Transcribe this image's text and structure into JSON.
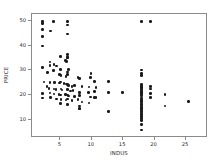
{
  "chart_data": {
    "type": "scatter",
    "title": "",
    "xlabel": "INDUS",
    "ylabel": "PRICE",
    "xlim": [
      0.5,
      28.5
    ],
    "ylim": [
      2.5,
      53.0
    ],
    "xticks": [
      5,
      10,
      15,
      20,
      25
    ],
    "yticks": [
      10,
      20,
      30,
      40,
      50
    ],
    "grid": false,
    "legend": null,
    "marker": {
      "shape": "circle",
      "color": "#1a1a1a",
      "size": 2.6
    },
    "background": "#ffffff",
    "frame_color": "#8a8a8a",
    "points": [
      [
        2.18,
        50.0
      ],
      [
        2.18,
        49.0
      ],
      [
        3.97,
        50.0
      ],
      [
        6.2,
        50.0
      ],
      [
        2.18,
        46.7
      ],
      [
        3.44,
        46.0
      ],
      [
        6.2,
        48.5
      ],
      [
        6.2,
        44.8
      ],
      [
        2.18,
        43.8
      ],
      [
        2.18,
        39.8
      ],
      [
        5.13,
        35.4
      ],
      [
        6.2,
        36.2
      ],
      [
        6.2,
        34.9
      ],
      [
        6.07,
        33.4
      ],
      [
        3.41,
        33.2
      ],
      [
        4.05,
        32.0
      ],
      [
        5.86,
        33.8
      ],
      [
        6.2,
        34.9
      ],
      [
        2.18,
        30.8
      ],
      [
        3.41,
        31.6
      ],
      [
        4.49,
        31.5
      ],
      [
        5.13,
        30.1
      ],
      [
        6.2,
        29.0
      ],
      [
        6.41,
        30.1
      ],
      [
        10.01,
        28.4
      ],
      [
        3.97,
        29.6
      ],
      [
        2.95,
        28.7
      ],
      [
        4.93,
        28.0
      ],
      [
        5.19,
        27.5
      ],
      [
        5.96,
        27.1
      ],
      [
        6.2,
        27.9
      ],
      [
        7.87,
        26.6
      ],
      [
        8.14,
        26.4
      ],
      [
        9.9,
        26.6
      ],
      [
        10.59,
        25.0
      ],
      [
        12.83,
        25.0
      ],
      [
        2.46,
        24.8
      ],
      [
        3.37,
        24.7
      ],
      [
        4.15,
        24.6
      ],
      [
        4.93,
        24.4
      ],
      [
        5.13,
        24.8
      ],
      [
        5.64,
        24.3
      ],
      [
        6.09,
        24.0
      ],
      [
        6.2,
        23.9
      ],
      [
        6.41,
        23.4
      ],
      [
        6.91,
        23.1
      ],
      [
        7.38,
        23.3
      ],
      [
        8.56,
        22.9
      ],
      [
        9.69,
        22.8
      ],
      [
        10.81,
        22.6
      ],
      [
        2.89,
        23.0
      ],
      [
        3.24,
        22.2
      ],
      [
        4.03,
        22.0
      ],
      [
        4.39,
        21.7
      ],
      [
        5.19,
        21.9
      ],
      [
        5.32,
        21.6
      ],
      [
        6.2,
        21.7
      ],
      [
        6.66,
        21.2
      ],
      [
        7.07,
        21.4
      ],
      [
        8.14,
        20.6
      ],
      [
        9.59,
        20.4
      ],
      [
        10.59,
        20.8
      ],
      [
        2.18,
        20.1
      ],
      [
        3.41,
        20.3
      ],
      [
        4.05,
        19.9
      ],
      [
        4.86,
        19.6
      ],
      [
        5.13,
        19.4
      ],
      [
        5.86,
        19.8
      ],
      [
        6.2,
        19.4
      ],
      [
        6.41,
        19.1
      ],
      [
        7.38,
        18.9
      ],
      [
        8.14,
        19.2
      ],
      [
        9.9,
        18.7
      ],
      [
        10.81,
        18.5
      ],
      [
        12.83,
        20.6
      ],
      [
        15.04,
        20.6
      ],
      [
        2.18,
        18.2
      ],
      [
        3.44,
        18.4
      ],
      [
        4.49,
        17.8
      ],
      [
        5.19,
        17.5
      ],
      [
        5.96,
        17.4
      ],
      [
        6.2,
        17.8
      ],
      [
        6.91,
        17.2
      ],
      [
        7.87,
        17.5
      ],
      [
        8.56,
        16.6
      ],
      [
        9.69,
        16.1
      ],
      [
        10.59,
        18.4
      ],
      [
        5.13,
        16.0
      ],
      [
        6.2,
        15.6
      ],
      [
        8.14,
        14.9
      ],
      [
        8.14,
        13.6
      ],
      [
        8.14,
        13.8
      ],
      [
        12.83,
        12.7
      ],
      [
        18.1,
        29.8
      ],
      [
        18.1,
        28.4
      ],
      [
        18.1,
        27.5
      ],
      [
        18.1,
        23.7
      ],
      [
        18.1,
        23.1
      ],
      [
        18.1,
        22.6
      ],
      [
        18.1,
        22.0
      ],
      [
        18.1,
        21.9
      ],
      [
        18.1,
        21.2
      ],
      [
        18.1,
        20.8
      ],
      [
        18.1,
        20.6
      ],
      [
        18.1,
        20.1
      ],
      [
        18.1,
        19.9
      ],
      [
        18.1,
        19.5
      ],
      [
        18.1,
        19.1
      ],
      [
        18.1,
        18.3
      ],
      [
        18.1,
        17.8
      ],
      [
        18.1,
        17.2
      ],
      [
        18.1,
        16.8
      ],
      [
        18.1,
        16.1
      ],
      [
        18.1,
        15.6
      ],
      [
        18.1,
        15.0
      ],
      [
        18.1,
        14.5
      ],
      [
        18.1,
        14.1
      ],
      [
        18.1,
        13.8
      ],
      [
        18.1,
        13.4
      ],
      [
        18.1,
        12.7
      ],
      [
        18.1,
        12.0
      ],
      [
        18.1,
        11.3
      ],
      [
        18.1,
        10.5
      ],
      [
        18.1,
        9.7
      ],
      [
        18.1,
        8.8
      ],
      [
        18.1,
        7.2
      ],
      [
        18.1,
        5.0
      ],
      [
        18.1,
        50.0
      ],
      [
        19.58,
        50.0
      ],
      [
        19.58,
        23.1
      ],
      [
        19.58,
        21.9
      ],
      [
        19.58,
        20.1
      ],
      [
        19.58,
        18.4
      ],
      [
        21.89,
        19.7
      ],
      [
        21.89,
        15.0
      ],
      [
        25.65,
        16.8
      ]
    ]
  },
  "axis_text": {
    "xlabel": "INDUS",
    "ylabel": "PRICE"
  }
}
